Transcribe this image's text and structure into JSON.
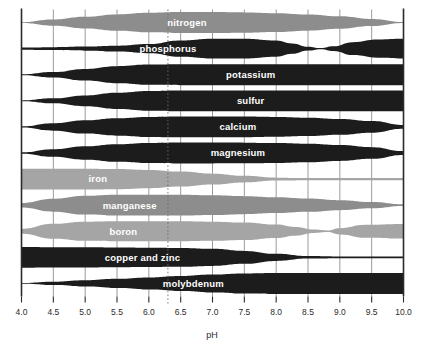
{
  "chart_data": {
    "type": "area",
    "title": "",
    "subtitle": "",
    "xlabel": "pH",
    "ylabel": "",
    "xlim": [
      4.0,
      10.0
    ],
    "grid": true,
    "legend_position": "none",
    "annotations": [
      {
        "name": "optimum-marker",
        "type": "dotted-vertical-line",
        "x": 6.3
      }
    ],
    "xticks": [
      "4.0",
      "4.5",
      "5.0",
      "5.5",
      "6.0",
      "6.5",
      "7.0",
      "7.5",
      "8.0",
      "8.5",
      "9.0",
      "9.5",
      "10.0"
    ],
    "xtick_values": [
      4.0,
      4.5,
      5.0,
      5.5,
      6.0,
      6.5,
      7.0,
      7.5,
      8.0,
      8.5,
      9.0,
      9.5,
      10.0
    ],
    "colors": {
      "dark_band": "#1c1c1c",
      "mid_band": "#8d8d8d",
      "light_band": "#a5a5a5",
      "axis": "#2b2b2b",
      "gridline": "#8f8f8f",
      "label_text": "#ffffff",
      "background": "#ffffff"
    },
    "value_scale": {
      "description": "Band half-width as fraction of the row's maximum availability (0 = unavailable, 1 = fully available)",
      "min": 0,
      "max": 1
    },
    "series": [
      {
        "name": "nitrogen",
        "label": "nitrogen",
        "color": "#8d8d8d",
        "tone": "mid",
        "row": 0,
        "label_x": 6.6,
        "x": [
          4.0,
          4.5,
          5.0,
          5.5,
          6.0,
          6.5,
          7.0,
          7.5,
          8.0,
          8.5,
          9.0,
          9.5,
          10.0
        ],
        "values": [
          0.04,
          0.3,
          0.56,
          0.78,
          0.93,
          1.0,
          1.0,
          0.97,
          0.9,
          0.78,
          0.6,
          0.34,
          0.05
        ]
      },
      {
        "name": "phosphorus",
        "label": "phosphorus",
        "color": "#1c1c1c",
        "tone": "dark",
        "row": 1,
        "label_x": 6.3,
        "x": [
          4.0,
          4.5,
          5.0,
          5.5,
          6.0,
          6.5,
          7.0,
          7.5,
          8.0,
          8.25,
          8.5,
          8.7,
          8.9,
          9.2,
          9.6,
          10.0
        ],
        "values": [
          0.1,
          0.14,
          0.2,
          0.28,
          0.44,
          0.78,
          0.95,
          0.95,
          0.78,
          0.5,
          0.18,
          0.05,
          0.22,
          0.62,
          0.88,
          0.95
        ]
      },
      {
        "name": "potassium",
        "label": "potassium",
        "color": "#1c1c1c",
        "tone": "dark",
        "row": 2,
        "label_x": 7.6,
        "x": [
          4.0,
          4.5,
          5.0,
          5.5,
          6.0,
          6.5,
          7.0,
          7.5,
          8.0,
          8.5,
          9.0,
          9.5,
          10.0
        ],
        "values": [
          0.04,
          0.26,
          0.56,
          0.82,
          0.97,
          1.0,
          1.0,
          1.0,
          1.0,
          1.0,
          1.0,
          1.0,
          1.0
        ]
      },
      {
        "name": "sulfur",
        "label": "sulfur",
        "color": "#1c1c1c",
        "tone": "dark",
        "row": 3,
        "label_x": 7.6,
        "x": [
          4.0,
          4.5,
          5.0,
          5.5,
          6.0,
          6.5,
          7.0,
          7.5,
          8.0,
          8.5,
          9.0,
          9.5,
          10.0
        ],
        "values": [
          0.04,
          0.24,
          0.52,
          0.78,
          0.95,
          1.0,
          1.0,
          1.0,
          1.0,
          1.0,
          1.0,
          1.0,
          1.0
        ]
      },
      {
        "name": "calcium",
        "label": "calcium",
        "color": "#1c1c1c",
        "tone": "dark",
        "row": 4,
        "label_x": 7.4,
        "x": [
          4.0,
          4.5,
          5.0,
          5.5,
          6.0,
          6.5,
          7.0,
          7.5,
          8.0,
          8.5,
          9.0,
          9.5,
          10.0
        ],
        "values": [
          0.06,
          0.36,
          0.64,
          0.84,
          0.96,
          1.0,
          1.0,
          0.99,
          0.95,
          0.88,
          0.76,
          0.56,
          0.18
        ]
      },
      {
        "name": "magnesium",
        "label": "magnesium",
        "color": "#1c1c1c",
        "tone": "dark",
        "row": 5,
        "label_x": 7.4,
        "x": [
          4.0,
          4.5,
          5.0,
          5.5,
          6.0,
          6.5,
          7.0,
          7.5,
          8.0,
          8.5,
          9.0,
          9.5,
          10.0
        ],
        "values": [
          0.06,
          0.36,
          0.64,
          0.84,
          0.96,
          1.0,
          1.0,
          0.99,
          0.95,
          0.88,
          0.76,
          0.56,
          0.18
        ]
      },
      {
        "name": "iron",
        "label": "iron",
        "color": "#a5a5a5",
        "tone": "light",
        "row": 6,
        "label_x": 5.2,
        "x": [
          4.0,
          4.5,
          5.0,
          5.5,
          6.0,
          6.5,
          7.0,
          7.5,
          8.0,
          8.5,
          9.0,
          9.5,
          10.0
        ],
        "values": [
          1.0,
          1.0,
          1.0,
          0.97,
          0.88,
          0.72,
          0.52,
          0.32,
          0.14,
          0.1,
          0.1,
          0.1,
          0.1
        ]
      },
      {
        "name": "manganese",
        "label": "manganese",
        "color": "#8d8d8d",
        "tone": "mid",
        "row": 7,
        "label_x": 5.7,
        "x": [
          4.0,
          4.5,
          5.0,
          5.5,
          6.0,
          6.5,
          7.0,
          7.5,
          8.0,
          8.5,
          9.0,
          9.5,
          10.0
        ],
        "values": [
          0.22,
          0.62,
          0.9,
          1.0,
          1.0,
          1.0,
          0.94,
          0.86,
          0.76,
          0.64,
          0.48,
          0.3,
          0.08
        ]
      },
      {
        "name": "boron",
        "label": "boron",
        "color": "#a5a5a5",
        "tone": "light",
        "row": 8,
        "label_x": 5.6,
        "x": [
          4.0,
          4.5,
          5.0,
          5.5,
          6.0,
          6.5,
          7.0,
          7.5,
          8.0,
          8.3,
          8.6,
          8.8,
          9.0,
          9.4,
          10.0
        ],
        "values": [
          0.24,
          0.72,
          0.92,
          0.96,
          0.96,
          0.96,
          0.92,
          0.84,
          0.64,
          0.42,
          0.16,
          0.08,
          0.3,
          0.62,
          0.7
        ]
      },
      {
        "name": "copper and zinc",
        "label": "copper and zinc",
        "color": "#1c1c1c",
        "tone": "dark",
        "row": 9,
        "label_x": 5.9,
        "x": [
          4.0,
          4.5,
          5.0,
          5.5,
          6.0,
          6.5,
          7.0,
          7.5,
          8.0,
          8.5,
          9.0,
          9.5,
          10.0
        ],
        "values": [
          1.0,
          0.98,
          0.96,
          0.94,
          0.92,
          0.9,
          0.82,
          0.62,
          0.34,
          0.12,
          0.08,
          0.08,
          0.08
        ]
      },
      {
        "name": "molybdenum",
        "label": "molybdenum",
        "color": "#1c1c1c",
        "tone": "dark",
        "row": 10,
        "label_x": 6.7,
        "x": [
          4.0,
          4.5,
          5.0,
          5.5,
          6.0,
          6.5,
          7.0,
          7.5,
          8.0,
          8.5,
          9.0,
          9.5,
          10.0
        ],
        "values": [
          0.04,
          0.16,
          0.3,
          0.44,
          0.58,
          0.72,
          0.86,
          0.96,
          1.0,
          1.0,
          1.0,
          1.0,
          1.0
        ]
      }
    ]
  },
  "axis": {
    "x_title": "pH",
    "tick_labels": [
      "4.0",
      "4.5",
      "5.0",
      "5.5",
      "6.0",
      "6.5",
      "7.0",
      "7.5",
      "8.0",
      "8.5",
      "9.0",
      "9.5",
      "10.0"
    ]
  }
}
